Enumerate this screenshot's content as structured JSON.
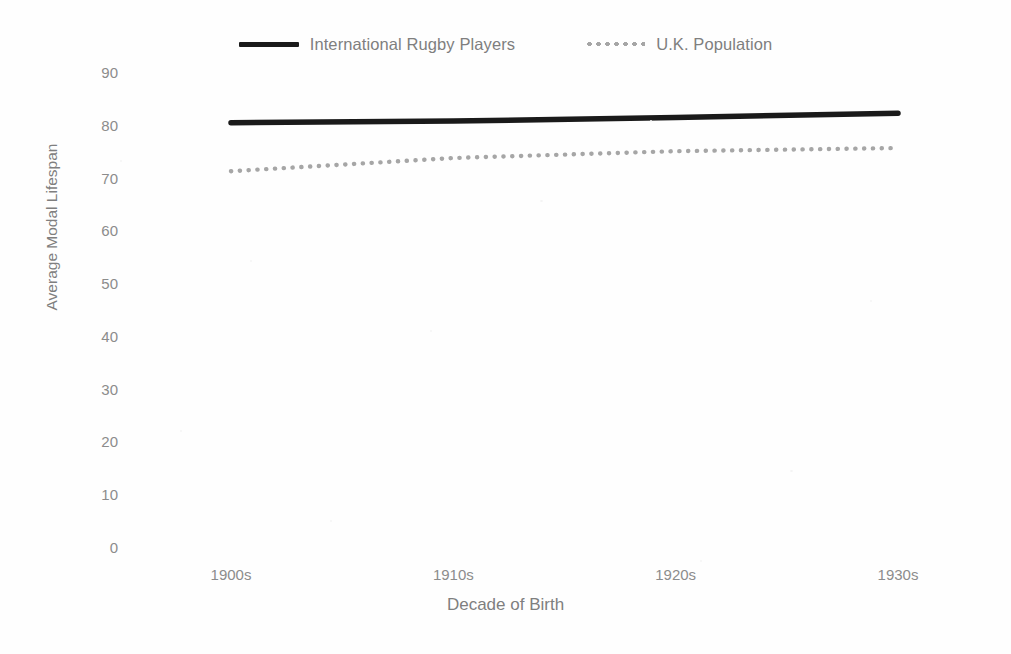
{
  "chart_data": {
    "type": "line",
    "title": "",
    "xlabel": "Decade of Birth",
    "ylabel": "Average Modal Lifespan",
    "categories": [
      "1900s",
      "1910s",
      "1920s",
      "1930s"
    ],
    "series": [
      {
        "name": "International Rugby Players",
        "style": "solid",
        "color": "#1a1a1a",
        "values": [
          80.4,
          80.7,
          81.4,
          82.2
        ]
      },
      {
        "name": "U.K. Population",
        "style": "dotted",
        "color": "#a6a6a6",
        "values": [
          71.2,
          73.7,
          75.0,
          75.6
        ]
      }
    ],
    "ylim": [
      0,
      90
    ],
    "yticks": [
      90,
      80,
      70,
      60,
      50,
      40,
      30,
      20,
      10,
      0
    ],
    "grid": false,
    "legend_position": "top"
  },
  "legend": {
    "entries": [
      {
        "label": "International Rugby Players",
        "swatch": "solid-line-swatch"
      },
      {
        "label": "U.K. Population",
        "swatch": "dotted-line-swatch"
      }
    ]
  },
  "axes": {
    "y_title": "Average Modal Lifespan",
    "x_title": "Decade of Birth",
    "y_tick_labels": [
      "90",
      "80",
      "70",
      "60",
      "50",
      "40",
      "30",
      "20",
      "10",
      "0"
    ],
    "x_tick_labels": [
      "1900s",
      "1910s",
      "1920s",
      "1930s"
    ]
  },
  "colors": {
    "background": "#fefefe",
    "text": "#7f7f7f",
    "series_rugby": "#1a1a1a",
    "series_uk": "#a6a6a6"
  }
}
